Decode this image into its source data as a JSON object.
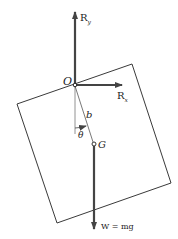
{
  "diagram": {
    "labels": {
      "ry": "R",
      "ry_sub": "y",
      "rx": "R",
      "rx_sub": "x",
      "origin": "O",
      "length": "b",
      "angle": "θ",
      "center": "G",
      "weight": "W = mg"
    },
    "colors": {
      "stroke": "#3a3a3a",
      "arrow": "#444444",
      "background": "#ffffff"
    }
  }
}
